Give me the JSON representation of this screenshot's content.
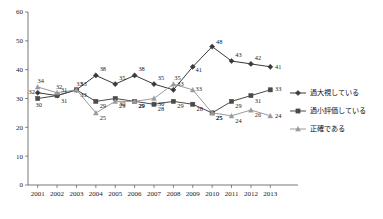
{
  "chart_data": {
    "type": "line",
    "title": "",
    "xlabel": "",
    "ylabel": "",
    "ylim": [
      0,
      60
    ],
    "ytick_step": 10,
    "grid": false,
    "legend_position": "right",
    "categories": [
      "2001",
      "2002",
      "2003",
      "2004",
      "2005",
      "2006",
      "2007",
      "2008",
      "2009",
      "2010",
      "2011",
      "2012",
      "2013"
    ],
    "yticks": [
      "0",
      "10",
      "20",
      "30",
      "40",
      "50",
      "60"
    ],
    "series": [
      {
        "name": "過大視している",
        "color": "#3a3a3a",
        "marker": "diamond",
        "values": [
          32,
          31,
          33,
          38,
          35,
          38,
          35,
          33,
          41,
          48,
          43,
          42,
          41
        ]
      },
      {
        "name": "過小評価している",
        "color": "#4a4a4a",
        "marker": "square",
        "values": [
          30,
          31,
          33,
          29,
          30,
          29,
          28,
          29,
          28,
          25,
          29,
          31,
          33
        ]
      },
      {
        "name": "正確である",
        "color": "#9a9a9a",
        "marker": "triangle",
        "values": [
          34,
          32,
          33,
          25,
          29,
          29,
          30,
          35,
          33,
          25,
          24,
          26,
          24
        ]
      }
    ]
  },
  "legend": {
    "items": [
      {
        "label": "過大視している"
      },
      {
        "label": "過小評価している"
      },
      {
        "label": "正確である"
      }
    ]
  }
}
